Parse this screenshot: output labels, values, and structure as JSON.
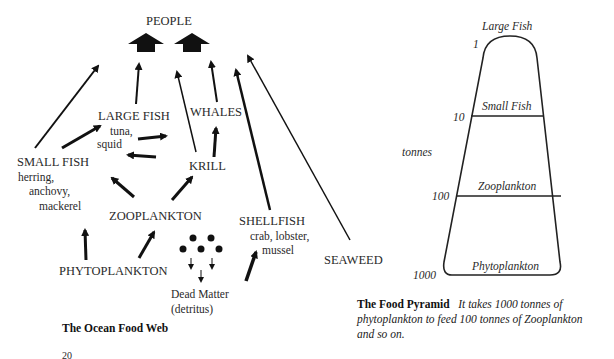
{
  "food_web": {
    "title": "The Ocean Food Web",
    "nodes": {
      "people": "PEOPLE",
      "large_fish": "LARGE FISH",
      "large_fish_examples": [
        "tuna,",
        "squid"
      ],
      "whales": "WHALES",
      "krill": "KRILL",
      "small_fish": "SMALL FISH",
      "small_fish_examples": [
        "herring,",
        "anchovy,",
        "mackerel"
      ],
      "zooplankton": "ZOOPLANKTON",
      "phytoplankton": "PHYTOPLANKTON",
      "shellfish": "SHELLFISH",
      "shellfish_examples": [
        "crab, lobster,",
        "mussel"
      ],
      "seaweed": "SEAWEED",
      "dead_matter": [
        "Dead Matter",
        "(detritus)"
      ]
    }
  },
  "food_pyramid": {
    "axis_label": "tonnes",
    "levels": [
      {
        "name": "Large Fish",
        "tonnes": "1"
      },
      {
        "name": "Small Fish",
        "tonnes": "10"
      },
      {
        "name": "Zooplankton",
        "tonnes": "100"
      },
      {
        "name": "Phytoplankton",
        "tonnes": "1000"
      }
    ],
    "caption_title": "The Food Pyramid",
    "caption_text_1": "It takes 1000 tonnes of",
    "caption_text_2": "phytoplankton to feed 100 tonnes of Zooplankton",
    "caption_text_3": "and so on."
  },
  "page_number": "20"
}
